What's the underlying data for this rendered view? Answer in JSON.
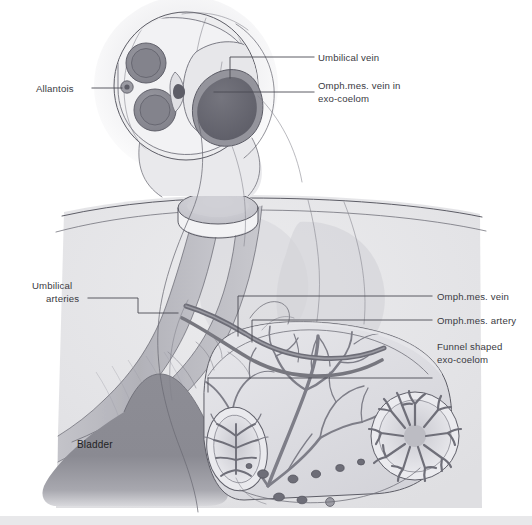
{
  "figure": {
    "background_color": "#ffffff",
    "bottom_border_color": "#e8e8ea"
  },
  "labels": {
    "allantois": "Allantois",
    "umbilical_vein": "Umbilical vein",
    "omph_vein_exocoelom_line1": "Omph.mes. vein in",
    "omph_vein_exocoelom_line2": "exo-coelom",
    "umbilical_arteries_line1": "Umbilical",
    "umbilical_arteries_line2": "arteries",
    "omph_vein": "Omph.mes. vein",
    "omph_artery": "Omph.mes. artery",
    "funnel_exocoelom_line1": "Funnel shaped",
    "funnel_exocoelom_line2": "exo-coelom",
    "bladder": "Bladder"
  },
  "colors": {
    "label_text": "#3a3a42",
    "bladder_text": "#1f1f24",
    "leader_line": "#4a4a52",
    "outline": "#5d5d66",
    "body_fill": "#e4e4e6",
    "body_fill_light": "#efeff1",
    "cord_fill": "#ededef",
    "artery_fill": "#8e8e96",
    "artery_ring": "#6f6f78",
    "vein_fill": "#6a6a73",
    "vein_ring": "#8a8a93",
    "allantois_fill": "#76767f",
    "bladder_fill": "#8a8a92",
    "vessel_band": "#b4b4bb",
    "vessel_dark": "#74747e",
    "sac_fill": "#dcdce0",
    "sac_fill_light": "#e9e9ed",
    "villi_stroke": "#808089",
    "node_fill": "#6e6e78"
  }
}
